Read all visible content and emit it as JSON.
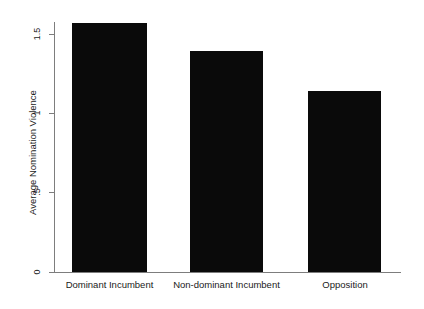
{
  "chart_data": {
    "type": "bar",
    "title": "",
    "xlabel": "",
    "ylabel": "Average Nomination Violence",
    "categories": [
      "Dominant Incumbent",
      "Non-dominant Incumbent",
      "Opposition"
    ],
    "values": [
      1.57,
      1.39,
      1.14
    ],
    "ylim": [
      0,
      1.6
    ],
    "y_ticks": [
      0,
      0.5,
      1,
      1.5
    ],
    "y_tick_labels": [
      "0",
      ".5",
      "1",
      "1.5"
    ],
    "grid": false,
    "legend": false,
    "bar_color": "#0a0a0a",
    "axis_color": "#7d7d7d",
    "background_color": "#ffffff"
  },
  "axis": {
    "y_title": "Average Nomination Violence",
    "tick_0": "0",
    "tick_half": ".5",
    "tick_1": "1",
    "tick_1_5": "1.5"
  },
  "bars": [
    {
      "label": "Dominant Incumbent",
      "value": 1.57
    },
    {
      "label": "Non-dominant Incumbent",
      "value": 1.39
    },
    {
      "label": "Opposition",
      "value": 1.14
    }
  ]
}
